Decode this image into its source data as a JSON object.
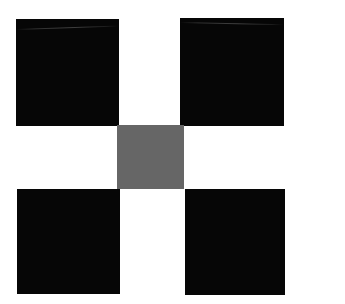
{
  "image": {
    "title": "Quincunx Pattern",
    "description": "Four black squares at the corners with a single gray square at the center on a white field",
    "width": 345,
    "height": 304,
    "background_color": "#ffffff"
  },
  "palette": {
    "black": "#060606",
    "dark_black": "#000000",
    "gray": "#666666",
    "white": "#ffffff"
  },
  "shapes": [
    {
      "name": "top-left-square",
      "label": "Top Left Square",
      "color": "#060606",
      "x": 16,
      "y": 19,
      "width": 103,
      "height": 107
    },
    {
      "name": "top-right-square",
      "label": "Top Right Square",
      "color": "#060606",
      "x": 180,
      "y": 18,
      "width": 104,
      "height": 108
    },
    {
      "name": "center-square",
      "label": "Center Square",
      "color": "#666666",
      "x": 117,
      "y": 125,
      "width": 67,
      "height": 64
    },
    {
      "name": "bottom-left-square",
      "label": "Bottom Left Square",
      "color": "#060606",
      "x": 17,
      "y": 189,
      "width": 103,
      "height": 105
    },
    {
      "name": "bottom-right-square",
      "label": "Bottom Right Square",
      "color": "#060606",
      "x": 185,
      "y": 189,
      "width": 100,
      "height": 106
    }
  ],
  "artifacts": [
    {
      "name": "top-left-scanline",
      "parent": "top-left-square",
      "x": 0,
      "y": 10,
      "width": 103,
      "rotate_deg": -1.9
    },
    {
      "name": "top-right-scanline",
      "parent": "top-right-square",
      "x": 0,
      "y": 4,
      "width": 104,
      "rotate_deg": 1.3
    }
  ]
}
